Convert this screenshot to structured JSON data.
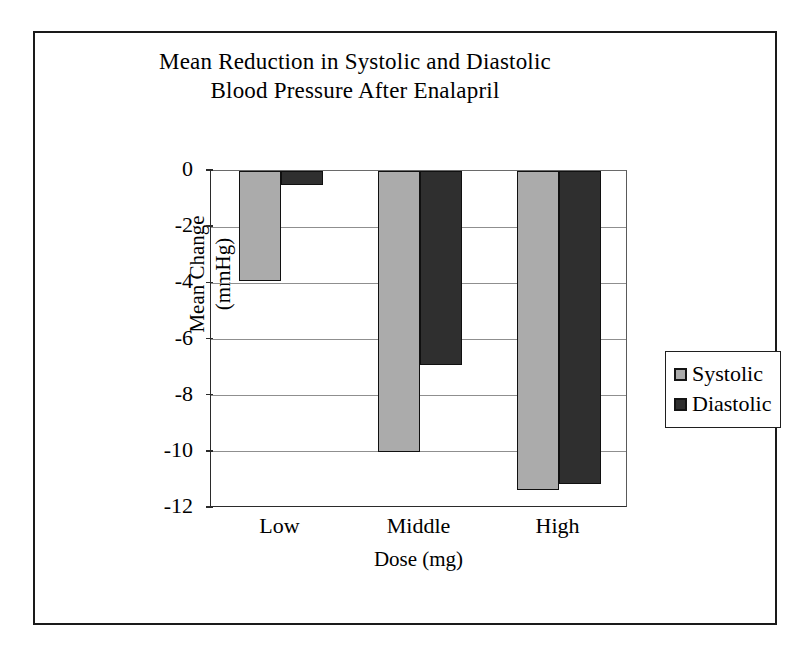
{
  "chart_data": {
    "type": "bar",
    "title": "Mean Reduction in Systolic and Diastolic Blood Pressure After Enalapril",
    "title_lines": [
      "Mean Reduction in Systolic and Diastolic",
      "Blood Pressure After Enalapril"
    ],
    "xlabel": "Dose (mg)",
    "ylabel": "Mean Change (mmHg)",
    "ylabel_lines": [
      "Mean Change",
      "(mmHg)"
    ],
    "categories": [
      "Low",
      "Middle",
      "High"
    ],
    "series": [
      {
        "name": "Systolic",
        "color": "#ababab",
        "values": [
          -3.9,
          -10.0,
          -11.35
        ]
      },
      {
        "name": "Diastolic",
        "color": "#2f2f2f",
        "values": [
          -0.5,
          -6.9,
          -11.15
        ]
      }
    ],
    "ylim": [
      -12,
      0
    ],
    "yticks": [
      0,
      -2,
      -4,
      -6,
      -8,
      -10,
      -12
    ],
    "ytick_labels": [
      "0",
      "-2",
      "-4",
      "-6",
      "-8",
      "-10",
      "-12"
    ],
    "grid": true,
    "grid_axis": "y",
    "legend_position": "right-outside",
    "legend_entries": [
      "Systolic",
      "Diastolic"
    ],
    "bar_orientation": "downward-from-zero"
  }
}
